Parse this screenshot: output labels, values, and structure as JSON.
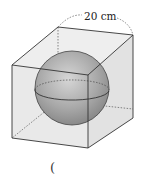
{
  "figure": {
    "type": "cube-with-inscribed-sphere",
    "dimension_label": "20 cm",
    "answer_blank": "(",
    "colors": {
      "background": "#ffffff",
      "box_face": "#e6e6e6",
      "box_edge": "#333333",
      "hidden_edge": "#555555",
      "sphere_light": "#d4d4d4",
      "sphere_dark": "#8a8a8a"
    }
  }
}
